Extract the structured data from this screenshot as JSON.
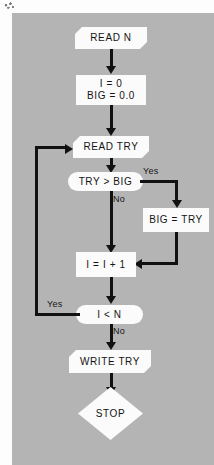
{
  "diagram": {
    "background_color": "#b4b4b4",
    "node_fill": "#fbfbfb",
    "line_color": "#111111",
    "nodes": {
      "read_n": {
        "label": "READ  N",
        "shape": "io"
      },
      "init": {
        "line1": "I = 0",
        "line2": "BIG = 0.0",
        "shape": "process"
      },
      "read_try": {
        "label": "READ  TRY",
        "shape": "io"
      },
      "compare": {
        "label": "TRY > BIG",
        "shape": "decision"
      },
      "assign_big": {
        "label": "BIG = TRY",
        "shape": "process"
      },
      "increment": {
        "label": "I = I + 1",
        "shape": "process"
      },
      "loop_test": {
        "label": "I < N",
        "shape": "decision"
      },
      "write_try": {
        "label": "WRITE  TRY",
        "shape": "io"
      },
      "stop": {
        "label": "STOP",
        "shape": "terminal"
      }
    },
    "edge_labels": {
      "compare_yes": "Yes",
      "compare_no": "No",
      "loop_yes": "Yes",
      "loop_no": "No"
    }
  }
}
